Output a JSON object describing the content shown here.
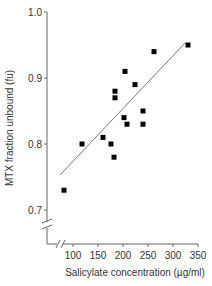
{
  "chart_data": {
    "type": "scatter",
    "title": "",
    "xlabel": "Salicylate concentration (µg/ml)",
    "ylabel": "MTX fraction unbound (fu)",
    "xlim": [
      50,
      350
    ],
    "ylim": [
      0.65,
      1.0
    ],
    "x_ticks": [
      "100",
      "150",
      "200",
      "250",
      "300",
      "350"
    ],
    "y_ticks": [
      "0.7",
      "0.8",
      "0.9",
      "1.0"
    ],
    "axis_breaks": {
      "x": true,
      "y": true
    },
    "grid": false,
    "legend": null,
    "series": [
      {
        "name": "observations",
        "marker": "square",
        "color": "#000000",
        "points": [
          {
            "x": 82,
            "y": 0.73
          },
          {
            "x": 118,
            "y": 0.8
          },
          {
            "x": 160,
            "y": 0.81
          },
          {
            "x": 176,
            "y": 0.8
          },
          {
            "x": 182,
            "y": 0.78
          },
          {
            "x": 184,
            "y": 0.87
          },
          {
            "x": 184,
            "y": 0.88
          },
          {
            "x": 202,
            "y": 0.84
          },
          {
            "x": 204,
            "y": 0.91
          },
          {
            "x": 208,
            "y": 0.83
          },
          {
            "x": 224,
            "y": 0.89
          },
          {
            "x": 240,
            "y": 0.85
          },
          {
            "x": 240,
            "y": 0.83
          },
          {
            "x": 262,
            "y": 0.94
          },
          {
            "x": 330,
            "y": 0.95
          }
        ]
      },
      {
        "name": "regression line",
        "type": "line",
        "color": "#777777",
        "points": [
          {
            "x": 74,
            "y": 0.753
          },
          {
            "x": 324,
            "y": 0.953
          }
        ]
      }
    ]
  }
}
